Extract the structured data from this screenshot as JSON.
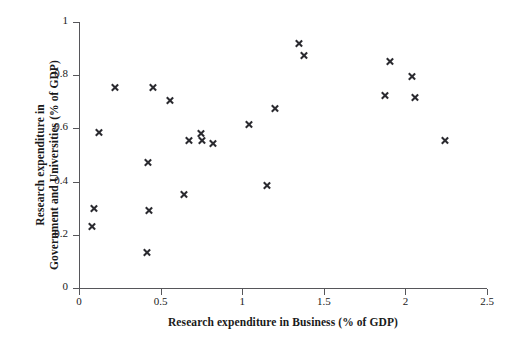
{
  "chart_data": {
    "type": "scatter",
    "title": "",
    "xlabel": "Research expenditure in Business (% of GDP)",
    "ylabel_line1": "Research expenditure in",
    "ylabel_line2": "Government and Universities (% of GDP)",
    "xlim": [
      0,
      2.5
    ],
    "ylim": [
      0,
      1
    ],
    "xticks": [
      "0",
      "0.5",
      "1",
      "1.5",
      "2",
      "2.5"
    ],
    "xtick_values": [
      0,
      0.5,
      1,
      1.5,
      2,
      2.5
    ],
    "yticks": [
      "0",
      "0.2",
      "0.4",
      "0.6",
      "0.8",
      "1"
    ],
    "ytick_values": [
      0,
      0.2,
      0.4,
      0.6,
      0.8,
      1
    ],
    "grid": false,
    "legend": "none",
    "marker": "x",
    "marker_color": "#2b2b30",
    "axis_color": "#56565a",
    "background": "#ffffff",
    "points": [
      {
        "x": 0.08,
        "y": 0.23
      },
      {
        "x": 0.09,
        "y": 0.3
      },
      {
        "x": 0.12,
        "y": 0.585
      },
      {
        "x": 0.22,
        "y": 0.755
      },
      {
        "x": 0.415,
        "y": 0.135
      },
      {
        "x": 0.43,
        "y": 0.29
      },
      {
        "x": 0.42,
        "y": 0.47
      },
      {
        "x": 0.45,
        "y": 0.755
      },
      {
        "x": 0.555,
        "y": 0.705
      },
      {
        "x": 0.645,
        "y": 0.35
      },
      {
        "x": 0.67,
        "y": 0.555
      },
      {
        "x": 0.745,
        "y": 0.58
      },
      {
        "x": 0.755,
        "y": 0.555
      },
      {
        "x": 0.82,
        "y": 0.545
      },
      {
        "x": 1.04,
        "y": 0.615
      },
      {
        "x": 1.15,
        "y": 0.385
      },
      {
        "x": 1.2,
        "y": 0.675
      },
      {
        "x": 1.345,
        "y": 0.92
      },
      {
        "x": 1.38,
        "y": 0.875
      },
      {
        "x": 1.875,
        "y": 0.725
      },
      {
        "x": 1.905,
        "y": 0.85
      },
      {
        "x": 2.04,
        "y": 0.795
      },
      {
        "x": 2.06,
        "y": 0.715
      },
      {
        "x": 2.24,
        "y": 0.555
      }
    ]
  }
}
